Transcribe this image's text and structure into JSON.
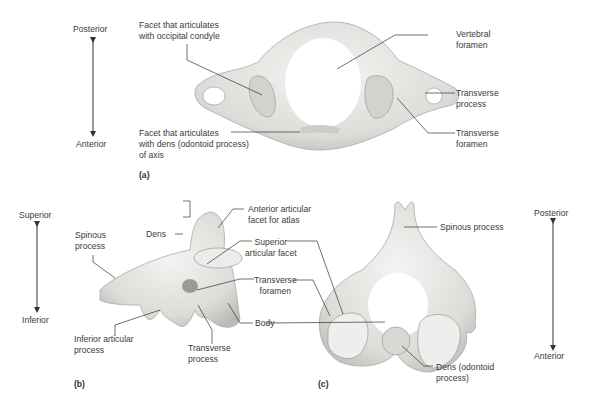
{
  "figure": {
    "panel_a": {
      "label": "(a)",
      "orientation": {
        "top": "Posterior",
        "bottom": "Anterior"
      },
      "callouts": {
        "occipital_facet": "Facet that articulates\nwith occipital condyle",
        "dens_facet": "Facet that articulates\nwith dens (odontoid process)\nof axis",
        "vertebral_foramen": "Vertebral\nforamen",
        "transverse_process": "Transverse\nprocess",
        "transverse_foramen": "Transverse\nforamen"
      }
    },
    "panel_b": {
      "label": "(b)",
      "orientation": {
        "top": "Superior",
        "bottom": "Inferior"
      },
      "callouts": {
        "dens": "Dens",
        "spinous_process": "Spinous\nprocess",
        "anterior_facet": "Anterior articular\nfacet for atlas",
        "superior_facet": "Superior\narticular facet",
        "transverse_foramen": "Transverse\nforamen",
        "body": "Body",
        "inferior_process": "Inferior articular\nprocess",
        "transverse_process": "Transverse\nprocess"
      }
    },
    "panel_c": {
      "label": "(c)",
      "orientation": {
        "top": "Posterior",
        "bottom": "Anterior"
      },
      "callouts": {
        "spinous_process": "Spinous process",
        "dens": "Dens (odontoid\nprocess)"
      }
    },
    "colors": {
      "bone": "#e6e6e4",
      "bone_shadow": "#bdbdba",
      "line": "#333333",
      "text": "#3a3a3a"
    }
  }
}
